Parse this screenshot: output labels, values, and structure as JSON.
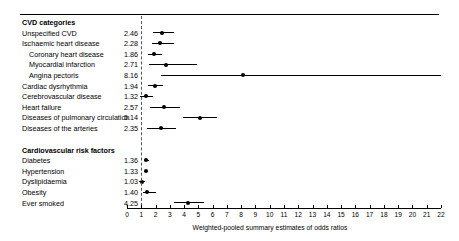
{
  "chart_data": {
    "type": "forest",
    "title": "",
    "xlabel": "Weighted-pooled summary estimates of odds ratios",
    "ylabel": "",
    "xlim": [
      0,
      22
    ],
    "xticks": [
      0,
      1,
      2,
      3,
      4,
      5,
      6,
      7,
      8,
      9,
      10,
      11,
      12,
      13,
      14,
      15,
      16,
      17,
      18,
      19,
      20,
      21,
      22
    ],
    "xticklabels": [
      "0",
      "1",
      "2",
      "3",
      "4",
      "5",
      "6",
      "7",
      "8",
      "9",
      "10",
      "11",
      "12",
      "13",
      "14",
      "15",
      "16",
      "17",
      "18",
      "19",
      "20",
      "21",
      "22"
    ],
    "reference_line": 1,
    "grid": false,
    "legend": "none",
    "value_column_header": "",
    "sections": [
      {
        "heading": "CVD categories",
        "rows": [
          {
            "label": "Unspecified CVD",
            "indent": 0,
            "estimate": 2.46,
            "value_text": "2.46",
            "ci_low": 1.82,
            "ci_high": 3.3
          },
          {
            "label": "Ischaemic heart disease",
            "indent": 0,
            "estimate": 2.28,
            "value_text": "2.28",
            "ci_low": 1.72,
            "ci_high": 3.28
          },
          {
            "label": "Coronary heart disease",
            "indent": 1,
            "estimate": 1.86,
            "value_text": "1.86",
            "ci_low": 1.45,
            "ci_high": 2.42
          },
          {
            "label": "Myocardial infarction",
            "indent": 1,
            "estimate": 2.71,
            "value_text": "2.71",
            "ci_low": 1.52,
            "ci_high": 4.92
          },
          {
            "label": "Angina pectoris",
            "indent": 1,
            "estimate": 8.16,
            "value_text": "8.16",
            "ci_low": 2.35,
            "ci_high": 22.0
          },
          {
            "label": "Cardiac dysrhythmia",
            "indent": 0,
            "estimate": 1.94,
            "value_text": "1.94",
            "ci_low": 1.5,
            "ci_high": 2.52
          },
          {
            "label": "Cerebrovascular disease",
            "indent": 0,
            "estimate": 1.32,
            "value_text": "1.32",
            "ci_low": 0.9,
            "ci_high": 1.85
          },
          {
            "label": "Heart failure",
            "indent": 0,
            "estimate": 2.57,
            "value_text": "2.57",
            "ci_low": 1.62,
            "ci_high": 3.72
          },
          {
            "label": "Diseases of pulmonary circulation",
            "indent": 0,
            "estimate": 5.14,
            "value_text": "5.14",
            "ci_low": 3.9,
            "ci_high": 6.3
          },
          {
            "label": "Diseases of the arteries",
            "indent": 0,
            "estimate": 2.35,
            "value_text": "2.35",
            "ci_low": 1.4,
            "ci_high": 3.42
          }
        ]
      },
      {
        "heading": "Cardiovascular risk factors",
        "rows": [
          {
            "label": "Diabetes",
            "indent": 0,
            "estimate": 1.36,
            "value_text": "1.36",
            "ci_low": 1.22,
            "ci_high": 1.52
          },
          {
            "label": "Hypertension",
            "indent": 0,
            "estimate": 1.33,
            "value_text": "1.33",
            "ci_low": 1.2,
            "ci_high": 1.48
          },
          {
            "label": "Dyslipidaemia",
            "indent": 0,
            "estimate": 1.03,
            "value_text": "1.03",
            "ci_low": 0.86,
            "ci_high": 1.24
          },
          {
            "label": "Obesity",
            "indent": 0,
            "estimate": 1.4,
            "value_text": "1.40",
            "ci_low": 1.14,
            "ci_high": 2.0
          },
          {
            "label": "Ever smoked",
            "indent": 0,
            "estimate": 4.25,
            "value_text": "4.25",
            "ci_low": 3.28,
            "ci_high": 5.38
          }
        ]
      }
    ]
  }
}
